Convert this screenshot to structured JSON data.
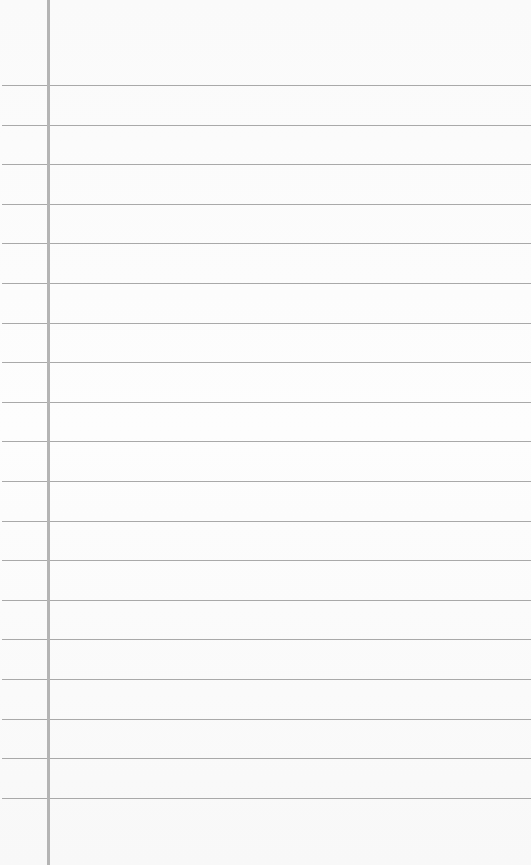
{
  "page": {
    "type": "lined-notepad",
    "background_color": "#fcfcfc",
    "rule_color": "#a9a9a9",
    "margin_color": "#b4b4b4",
    "margin_x": 47,
    "rule_start_y": 85,
    "rule_spacing": 39.6,
    "rule_count": 19,
    "text_lines": []
  }
}
